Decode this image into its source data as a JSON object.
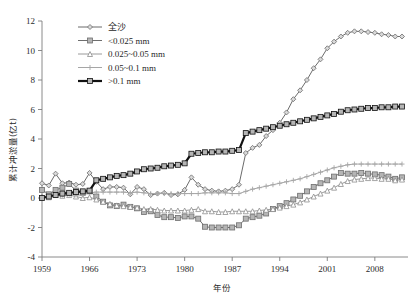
{
  "chart_data": {
    "type": "line",
    "title": "",
    "xlabel": "年份",
    "ylabel": "累计冲淤量(亿t)",
    "xlim": [
      1959,
      2012
    ],
    "ylim": [
      -4,
      12
    ],
    "grid": false,
    "legend_position": "top-left",
    "x_ticks": [
      "1959",
      "1966",
      "1973",
      "1980",
      "1987",
      "1994",
      "2001",
      "2008"
    ],
    "x_tick_values": [
      1959,
      1966,
      1973,
      1980,
      1987,
      1994,
      2001,
      2008
    ],
    "y_ticks": [
      "-4",
      "-2",
      "0",
      "2",
      "4",
      "6",
      "8",
      "10",
      "12"
    ],
    "y_tick_values": [
      -4,
      -2,
      0,
      2,
      4,
      6,
      8,
      10,
      12
    ],
    "x": [
      1959,
      1960,
      1961,
      1962,
      1963,
      1964,
      1965,
      1966,
      1967,
      1968,
      1969,
      1970,
      1971,
      1972,
      1973,
      1974,
      1975,
      1976,
      1977,
      1978,
      1979,
      1980,
      1981,
      1982,
      1983,
      1984,
      1985,
      1986,
      1987,
      1988,
      1989,
      1990,
      1991,
      1992,
      1993,
      1994,
      1995,
      1996,
      1997,
      1998,
      1999,
      2000,
      2001,
      2002,
      2003,
      2004,
      2005,
      2006,
      2007,
      2008,
      2009,
      2010,
      2011,
      2012
    ],
    "series": [
      {
        "name": "全沙",
        "marker": "diamond",
        "color": "#6b6b6b",
        "line_width": 1.0,
        "values": [
          1.0,
          0.85,
          1.65,
          1.0,
          1.05,
          0.9,
          0.95,
          1.7,
          1.1,
          0.6,
          0.75,
          0.75,
          0.7,
          0.25,
          0.75,
          0.6,
          0.2,
          0.3,
          0.35,
          0.2,
          0.25,
          0.55,
          1.4,
          0.9,
          0.6,
          0.5,
          0.45,
          0.5,
          0.6,
          0.9,
          3.05,
          3.4,
          3.6,
          4.2,
          4.6,
          5.1,
          5.8,
          6.7,
          7.3,
          8.0,
          8.8,
          9.4,
          10.15,
          10.6,
          10.95,
          11.2,
          11.3,
          11.3,
          11.25,
          11.2,
          11.1,
          11.05,
          10.95,
          10.95
        ]
      },
      {
        "name": "<0.025 mm",
        "marker": "square",
        "color": "#6e6e6e",
        "line_width": 1.0,
        "values": [
          0.55,
          0.25,
          0.55,
          0.7,
          0.95,
          0.5,
          0.35,
          0.45,
          0.1,
          -0.25,
          -0.5,
          -0.55,
          -0.45,
          -0.6,
          -0.7,
          -0.95,
          -0.9,
          -1.15,
          -1.3,
          -1.3,
          -1.35,
          -1.25,
          -1.25,
          -1.4,
          -1.95,
          -2.0,
          -2.0,
          -2.0,
          -2.0,
          -1.85,
          -1.4,
          -1.3,
          -1.2,
          -1.05,
          -0.75,
          -0.55,
          -0.35,
          -0.1,
          0.15,
          0.45,
          0.75,
          1.0,
          1.2,
          1.45,
          1.7,
          1.65,
          1.65,
          1.7,
          1.65,
          1.6,
          1.55,
          1.45,
          1.3,
          1.4
        ]
      },
      {
        "name": "0.025~0.05 mm",
        "marker": "triangle",
        "color": "#8e8e8e",
        "line_width": 0.9,
        "values": [
          0.1,
          0.05,
          0.2,
          0.15,
          0.2,
          0.1,
          0.0,
          0.05,
          -0.1,
          -0.25,
          -0.4,
          -0.5,
          -0.55,
          -0.6,
          -0.65,
          -0.75,
          -0.75,
          -0.8,
          -0.85,
          -0.85,
          -0.85,
          -0.85,
          -0.8,
          -0.75,
          -0.9,
          -0.9,
          -0.95,
          -0.95,
          -0.9,
          -0.9,
          -0.9,
          -0.9,
          -0.85,
          -0.8,
          -0.75,
          -0.65,
          -0.55,
          -0.45,
          -0.3,
          -0.1,
          0.1,
          0.3,
          0.5,
          0.7,
          0.95,
          1.15,
          1.25,
          1.3,
          1.35,
          1.35,
          1.3,
          1.3,
          1.2,
          1.25
        ]
      },
      {
        "name": "0.05~0.1 mm",
        "marker": "plus",
        "color": "#a6a6a6",
        "line_width": 1.0,
        "values": [
          0.1,
          0.1,
          0.2,
          0.2,
          0.25,
          0.2,
          0.2,
          0.35,
          0.4,
          0.4,
          0.4,
          0.4,
          0.4,
          0.35,
          0.4,
          0.35,
          0.3,
          0.3,
          0.3,
          0.3,
          0.3,
          0.3,
          0.3,
          0.3,
          0.35,
          0.35,
          0.35,
          0.35,
          0.3,
          0.3,
          0.45,
          0.6,
          0.7,
          0.8,
          0.9,
          1.0,
          1.1,
          1.2,
          1.3,
          1.45,
          1.6,
          1.75,
          1.9,
          2.05,
          2.15,
          2.25,
          2.3,
          2.3,
          2.3,
          2.3,
          2.3,
          2.3,
          2.3,
          2.3
        ]
      },
      {
        "name": ">0.1 mm",
        "marker": "square",
        "color": "#111111",
        "line_width": 2.2,
        "values": [
          0.0,
          0.1,
          0.2,
          0.3,
          0.35,
          0.4,
          0.45,
          0.5,
          1.2,
          1.3,
          1.4,
          1.5,
          1.55,
          1.65,
          1.8,
          1.95,
          2.0,
          2.05,
          2.15,
          2.2,
          2.25,
          2.35,
          3.0,
          3.05,
          3.1,
          3.1,
          3.15,
          3.15,
          3.2,
          3.25,
          4.4,
          4.5,
          4.6,
          4.7,
          4.8,
          4.9,
          5.0,
          5.1,
          5.2,
          5.3,
          5.4,
          5.5,
          5.6,
          5.7,
          5.85,
          5.95,
          6.0,
          6.05,
          6.1,
          6.1,
          6.15,
          6.15,
          6.2,
          6.2
        ]
      }
    ]
  },
  "legend": {
    "items": [
      {
        "label": "全沙"
      },
      {
        "label": "<0.025 mm"
      },
      {
        "label": "0.025~0.05 mm"
      },
      {
        "label": "0.05~0.1 mm"
      },
      {
        "label": ">0.1 mm"
      }
    ]
  }
}
